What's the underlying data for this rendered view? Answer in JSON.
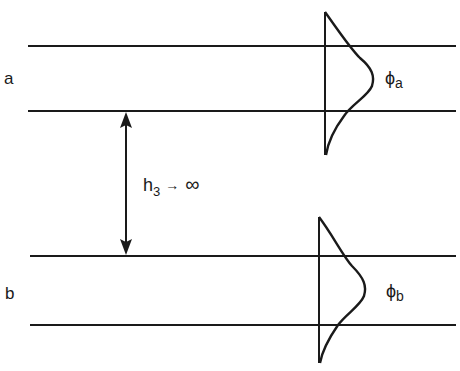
{
  "diagram": {
    "colors": {
      "stroke": "#1a1a1a",
      "background": "#ffffff"
    },
    "guides": [
      {
        "id": "a",
        "label": "a",
        "top_y": 46,
        "bottom_y": 111,
        "x_start": 28,
        "x_end": 456
      },
      {
        "id": "b",
        "label": "b",
        "top_y": 256,
        "bottom_y": 325,
        "x_start": 30,
        "x_end": 456
      }
    ],
    "separation": {
      "symbol": "h",
      "subscript": "3",
      "arrow": "→",
      "limit": "∞",
      "arrow_x": 126
    },
    "modes": [
      {
        "guide": "a",
        "symbol": "ϕ",
        "subscript": "a",
        "axis_x": 325,
        "axis_top": 12,
        "axis_bottom": 155,
        "peak_x": 373,
        "peak_y": 78
      },
      {
        "guide": "b",
        "symbol": "ϕ",
        "subscript": "b",
        "axis_x": 319,
        "axis_top": 217,
        "axis_bottom": 363,
        "peak_x": 365,
        "peak_y": 290
      }
    ]
  }
}
